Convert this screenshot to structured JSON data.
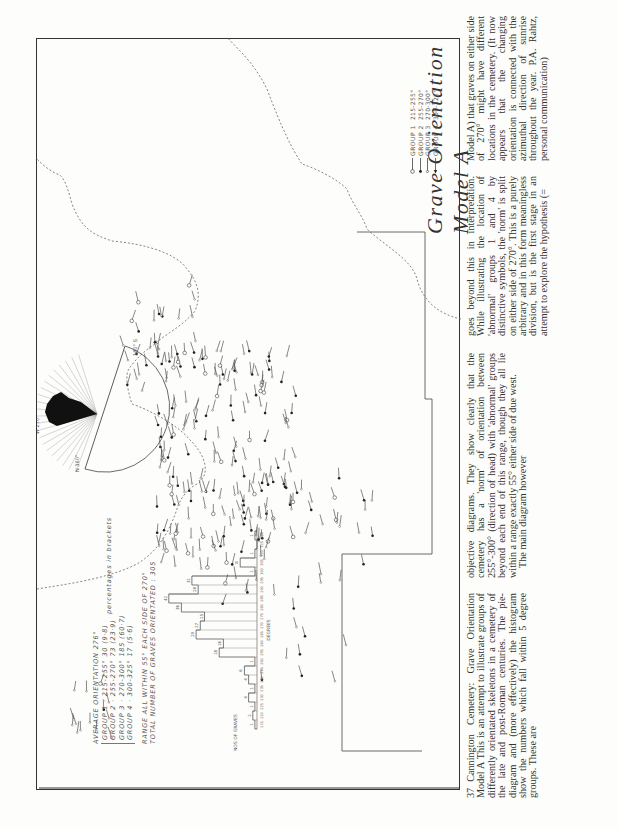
{
  "figure": {
    "title": "Grave Orientation Model A",
    "legend": [
      {
        "symbol": "open-circle-icon",
        "group": "GROUP 1",
        "range": "215-255°"
      },
      {
        "symbol": "filled-dot-icon",
        "group": "GROUP 2",
        "range": "255-270°"
      },
      {
        "symbol": "small-circle-icon",
        "group": "GROUP 3",
        "range": "270-300°"
      },
      {
        "symbol": "filled-arrow-icon",
        "group": "GROUP 4",
        "range": "300-325°"
      }
    ],
    "stats": {
      "average": "AVERAGE ORIENTATION 276°",
      "groups": [
        "GROUP 1 · 215-255°   30 (9·8)",
        "GROUP 2 · 255-270°   73 (23·9)",
        "GROUP 3 · 270-300°  185 (60·7)",
        "GROUP 4 · 300-325°   17 (5·6)"
      ],
      "percentages_note": "percentages in brackets",
      "range": "RANGE ALL WITHIN 55° EACH SIDE OF 270°",
      "total": "TOTAL NUMBER OF GRAVES ORIENTATED : 305"
    },
    "histogram": {
      "ylabel": "NOS OF GRAVES",
      "xlabel": "DEGREES"
    },
    "pie": {
      "labels": [
        "N 360°",
        "180° S",
        "W 270°",
        "300°",
        "240°",
        "210°"
      ]
    }
  },
  "chart_data": {
    "type": "bar",
    "xlabel": "DEGREES",
    "ylabel": "NOS OF GRAVES",
    "categories": [
      "215",
      "220",
      "225",
      "230",
      "235",
      "240",
      "245",
      "250",
      "255",
      "260",
      "265",
      "270",
      "275",
      "280",
      "285",
      "290",
      "295",
      "300",
      "305",
      "310",
      "315",
      "320"
    ],
    "values": [
      1,
      2,
      1,
      4,
      1,
      4,
      6,
      1,
      18,
      16,
      29,
      27,
      25,
      36,
      42,
      28,
      31,
      1,
      8,
      1,
      0,
      1
    ],
    "ylim": [
      0,
      45
    ]
  },
  "text": {
    "caption_number": "37",
    "col1": "Cannington Cemetery: Grave Orientation Model A This is an attempt to illustrate groups of differently orientated skeletons in a cemetery of the late and post-Roman centuries. The pie-diagram and (more effectively) the histogram show the numbers which fall within 5 degree groups. These are",
    "col2a": "objective diagrams. They show clearly that the cemetery has a 'norm' of orientation between 255°-300° (direction of head) with 'abnormal' groups beyond each end of this range, though they all lie within a range exactly 55° either side of due west.",
    "col2b": "The main diagram however",
    "col3": "goes beyond this in interpretation. While illustrating the location of 'abnormal' groups 1 and 4 by distinctive symbols, the 'norm' is split on either side of 270°. This is a purely arbitrary and in this form meaningless division, but is the first stage in an attempt to explore the hypothesis (=",
    "col4": "Model A) that graves on either side of 270° might have different locations in the cemetery. (It now appears that the changing orientation is connected with the azimuthal direction of sunrise throughout the year. P.A. Rahtz, personal communication)"
  }
}
